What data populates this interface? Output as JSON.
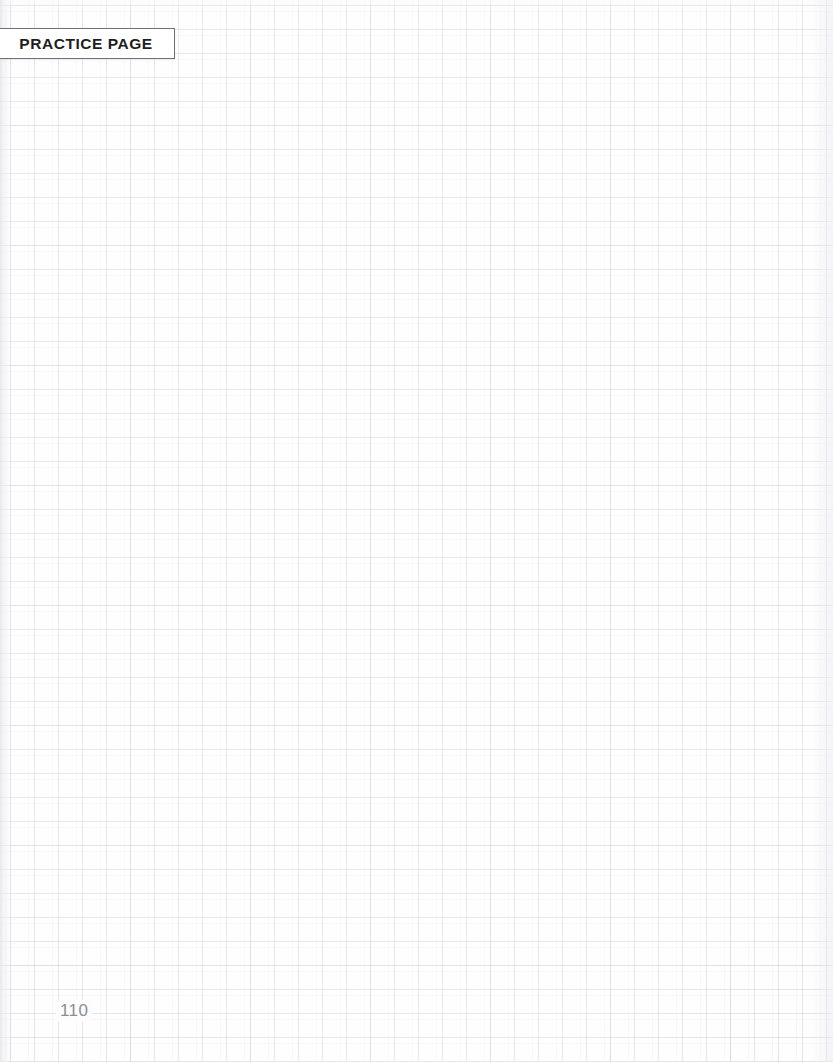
{
  "page": {
    "type": "graph-paper-worksheet",
    "background_color": "#fdfdfd",
    "grid": {
      "cell_size_px": 24,
      "line_color": "#b0b3bd",
      "minor_line_color": "#c8cad2",
      "accent_line_color": "#9699a5",
      "offset_x_px": 10,
      "offset_y_px": 5
    },
    "tab": {
      "label": "PRACTICE PAGE",
      "text_color": "#1e1e20",
      "border_color": "#6f7074",
      "background_color": "#ffffff"
    },
    "footer": {
      "page_number": "110",
      "text_color": "#8d8e93"
    },
    "content": {
      "body_text": "",
      "note": ""
    }
  }
}
